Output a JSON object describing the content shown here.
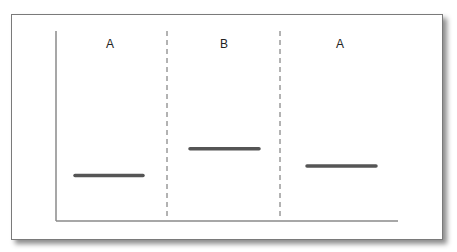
{
  "chart_data": {
    "type": "line",
    "title": "",
    "xlabel": "",
    "ylabel": "",
    "ylim": [
      0,
      1
    ],
    "grid": false,
    "legend": "none",
    "phases": [
      {
        "label": "A",
        "level": 0.24
      },
      {
        "label": "B",
        "level": 0.38
      },
      {
        "label": "A",
        "level": 0.29
      }
    ],
    "phase_change_lines": 2,
    "colors": {
      "axis": "#8a8a8a",
      "level_line": "#555555",
      "phase_divider": "#666666",
      "label": "#222222"
    }
  }
}
